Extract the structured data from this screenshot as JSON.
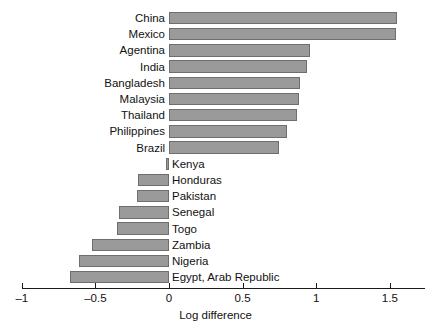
{
  "chart_data": {
    "type": "bar",
    "orientation": "horizontal",
    "title": "",
    "subtitle": "",
    "xlabel": "Log difference",
    "ylabel": "",
    "xlim": [
      -1.1,
      1.65
    ],
    "xticks": [
      -1,
      -0.5,
      0,
      0.5,
      1,
      1.5
    ],
    "xtick_labels": [
      "–1",
      "–0.5",
      "0",
      "0.5",
      "1",
      "1.5"
    ],
    "grid": false,
    "legend": null,
    "bar_color": "#9a9a9a",
    "bar_edge_color": "#6e6e6e",
    "categories": [
      "China",
      "Mexico",
      "Agentina",
      "India",
      "Bangladesh",
      "Malaysia",
      "Thailand",
      "Philippines",
      "Brazil",
      "Kenya",
      "Honduras",
      "Pakistan",
      "Senegal",
      "Togo",
      "Zambia",
      "Nigeria",
      "Egypt, Arab Republic"
    ],
    "values": [
      1.55,
      1.54,
      0.96,
      0.94,
      0.89,
      0.88,
      0.87,
      0.8,
      0.75,
      -0.02,
      -0.21,
      -0.22,
      -0.34,
      -0.35,
      -0.52,
      -0.61,
      -0.67
    ],
    "label_side": [
      "left",
      "left",
      "left",
      "left",
      "left",
      "left",
      "left",
      "left",
      "left",
      "right",
      "right",
      "right",
      "right",
      "right",
      "right",
      "right",
      "right"
    ]
  }
}
